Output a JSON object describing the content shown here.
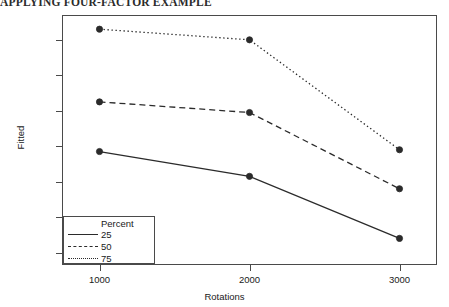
{
  "top_heading": "APPLYING FOUR-FACTOR EXAMPLE",
  "chart_data": {
    "type": "line",
    "title": "",
    "xlabel": "Rotations",
    "ylabel": "Fitted",
    "x": [
      1000,
      2000,
      3000
    ],
    "xtick_labels": [
      "1000",
      "2000",
      "3000"
    ],
    "ytick_labels": [
      "140",
      "160",
      "180",
      "200",
      "220",
      "240",
      "260"
    ],
    "yticks": [
      140,
      160,
      180,
      200,
      220,
      240,
      260
    ],
    "xlim": [
      750,
      3250
    ],
    "ylim": [
      133,
      274
    ],
    "grid": false,
    "markers": "filled-circle",
    "legend": {
      "title": "Percent",
      "position": "bottom-left-inside",
      "entries": [
        {
          "label": "25",
          "style": "solid"
        },
        {
          "label": "50",
          "style": "dashed"
        },
        {
          "label": "75",
          "style": "dotted"
        }
      ]
    },
    "series": [
      {
        "name": "25",
        "style": "solid",
        "color": "#2b2b2b",
        "values": [
          197,
          183,
          148
        ]
      },
      {
        "name": "50",
        "style": "dashed",
        "color": "#2b2b2b",
        "values": [
          225,
          219,
          176
        ]
      },
      {
        "name": "75",
        "style": "dotted",
        "color": "#2b2b2b",
        "values": [
          266,
          260,
          198
        ]
      }
    ]
  }
}
